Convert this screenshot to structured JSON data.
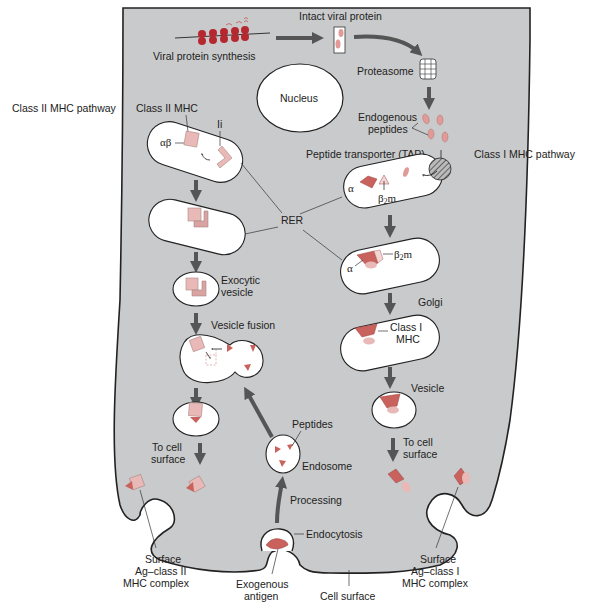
{
  "diagram": {
    "pathway_labels": {
      "class_ii": "Class II MHC pathway",
      "class_i": "Class I MHC pathway"
    },
    "cytoplasm": {
      "viral_protein_synthesis": "Viral protein synthesis",
      "intact_viral_protein": "Intact viral protein",
      "proteasome": "Proteasome",
      "endogenous_peptides_l1": "Endogenous",
      "endogenous_peptides_l2": "peptides",
      "nucleus": "Nucleus",
      "tap": "Peptide transporter (TAP)",
      "rer": "RER"
    },
    "class_ii_branch": {
      "class_ii_mhc": "Class II MHC",
      "alpha_beta": "αβ",
      "ii": "Ii",
      "exocytic_l1": "Exocytic",
      "exocytic_l2": "vesicle",
      "vesicle_fusion": "Vesicle fusion",
      "to_cell_l1": "To cell",
      "to_cell_l2": "surface",
      "surface_l1": "Surface",
      "surface_l2": "Ag–class II",
      "surface_l3": "MHC complex"
    },
    "class_i_branch": {
      "alpha": "α",
      "beta2m_beta": "β",
      "beta2m_sub": "2",
      "beta2m_m": "m",
      "golgi": "Golgi",
      "class_i_mhc_l1": "Class I",
      "class_i_mhc_l2": "MHC",
      "vesicle": "Vesicle",
      "to_cell_l1": "To cell",
      "to_cell_l2": "surface",
      "surface_l1": "Surface",
      "surface_l2": "Ag–class I",
      "surface_l3": "MHC complex"
    },
    "exogenous": {
      "peptides": "Peptides",
      "endosome": "Endosome",
      "processing": "Processing",
      "endocytosis": "Endocytosis",
      "exogenous_l1": "Exogenous",
      "exogenous_l2": "antigen",
      "cell_surface": "Cell surface"
    },
    "colors": {
      "cytoplasm": "#c9cacb",
      "organelle": "#ffffff",
      "class_ii_pink": "#e8b9b6",
      "class_i_red": "#c9625c",
      "peptide_pink": "#e09a98",
      "arrow": "#555555"
    }
  }
}
